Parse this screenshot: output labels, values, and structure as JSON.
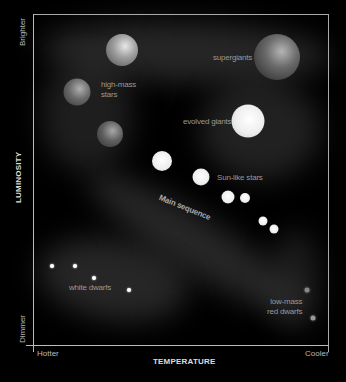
{
  "diagram": {
    "type": "Hertzsprung-Russell diagram",
    "y_axis": {
      "title": "LUMINOSITY",
      "top_label": "Brighter",
      "bottom_label": "Dimmer"
    },
    "x_axis": {
      "title": "TEMPERATURE",
      "left_label": "Hotter",
      "right_label": "Cooler"
    },
    "regions": [
      {
        "name": "high-mass-stars",
        "label_lines": [
          "high-mass",
          "stars"
        ]
      },
      {
        "name": "supergiants",
        "label_lines": [
          "supergiants"
        ]
      },
      {
        "name": "evolved-giants",
        "label_lines": [
          "evolved giants"
        ]
      },
      {
        "name": "sun-like-stars",
        "label_lines": [
          "Sun-like stars"
        ]
      },
      {
        "name": "main-sequence",
        "label_lines": [
          "Main sequence"
        ]
      },
      {
        "name": "white-dwarfs",
        "label_lines": [
          "white dwarfs"
        ]
      },
      {
        "name": "low-mass-red-dwarfs",
        "label_lines": [
          "low-mass",
          "red dwarfs"
        ]
      }
    ],
    "colors": {
      "background": "#000000",
      "axis": "#bbbbbb",
      "label": "#999999",
      "glow": "#3a3a3a"
    }
  }
}
